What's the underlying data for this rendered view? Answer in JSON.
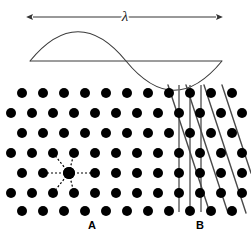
{
  "figure": {
    "title": "",
    "background_color": "#ffffff",
    "width": 251,
    "height": 241
  },
  "wave_panel": {
    "wavelength_symbol": "λ",
    "arrow_name": "wavelength-double-arrow",
    "arrow": {
      "x_start": 33,
      "x_end": 216,
      "y": 17,
      "color": "#333333",
      "stroke_width": 1,
      "heads": "both"
    },
    "baseline": {
      "x_start": 30,
      "x_end": 222,
      "y": 61,
      "color": "#3a3a3a",
      "stroke_width": 1
    },
    "sine": {
      "x_start": 30,
      "x_end": 222,
      "baseline_y": 61,
      "amplitude": 22,
      "periods": 1,
      "color": "#3a3a3a",
      "stroke_width": 1.1
    }
  },
  "lattice_panel": {
    "dot_color": "#000000",
    "dot_radius": 5,
    "rows": 7,
    "row_spacing": 20,
    "col_spacing": 21,
    "first_row_y": 93,
    "odd_row_x0": 22,
    "even_row_x0": 11,
    "odd_row_count": 11,
    "even_row_count": 12,
    "region_a": {
      "label": "A",
      "center_x": 69,
      "center_y": 173,
      "coordination": 6,
      "dash_color": "#000000",
      "dash_pattern": "2,2",
      "dash_width": 1.2,
      "description": "dashed radial bonds to six nearest neighbours"
    },
    "region_b": {
      "label": "B",
      "vertical_lines": {
        "x_positions": [
          179,
          190,
          201
        ],
        "y_start": 85,
        "y_end": 212,
        "color": "#6e6e6e",
        "stroke_width": 1.6
      },
      "diagonal_lines": {
        "color": "#4a4a4a",
        "stroke_width": 1.4,
        "top_x_positions": [
          168,
          186,
          204,
          222
        ],
        "slope_dx": 42,
        "slope_dy": 128
      }
    }
  },
  "labels": {
    "a": "A",
    "b": "B"
  }
}
